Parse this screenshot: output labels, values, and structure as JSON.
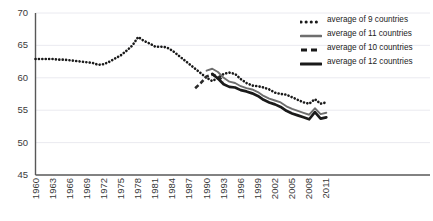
{
  "chart_data": {
    "type": "line",
    "title": "",
    "subtitle": "",
    "xlabel": "",
    "ylabel": "",
    "xlim": [
      1960,
      2012
    ],
    "ylim": [
      45,
      70
    ],
    "ytick_labels": [
      "70",
      "65",
      "60",
      "55",
      "50",
      "45"
    ],
    "ytick_values": [
      70,
      65,
      60,
      55,
      50,
      45
    ],
    "xtick_labels": [
      "1960",
      "1963",
      "1966",
      "1969",
      "1972",
      "1975",
      "1978",
      "1981",
      "1984",
      "1987",
      "1990",
      "1993",
      "1996",
      "1999",
      "2002",
      "2005",
      "2008",
      "2011"
    ],
    "xtick_values": [
      1960,
      1963,
      1966,
      1969,
      1972,
      1975,
      1978,
      1981,
      1984,
      1987,
      1990,
      1993,
      1996,
      1999,
      2002,
      2005,
      2008,
      2011
    ],
    "grid": true,
    "grid_axis": "y",
    "legend_position": "top-right",
    "series": [
      {
        "name": "average of 9 countries",
        "style": "dotted",
        "color": "#1a1a1a",
        "x": [
          1960,
          1961,
          1962,
          1963,
          1964,
          1965,
          1966,
          1967,
          1968,
          1969,
          1970,
          1971,
          1972,
          1973,
          1974,
          1975,
          1976,
          1977,
          1978,
          1979,
          1980,
          1981,
          1982,
          1983,
          1984,
          1985,
          1986,
          1987,
          1988,
          1989,
          1990,
          1991,
          1992,
          1993,
          1994,
          1995,
          1996,
          1997,
          1998,
          1999,
          2000,
          2001,
          2002,
          2003,
          2004,
          2005,
          2006,
          2007,
          2008,
          2009,
          2010,
          2011
        ],
        "values": [
          62.9,
          62.9,
          62.9,
          62.9,
          62.8,
          62.8,
          62.7,
          62.6,
          62.5,
          62.4,
          62.3,
          62.0,
          62.1,
          62.5,
          63.0,
          63.5,
          64.2,
          65.0,
          66.3,
          65.7,
          65.3,
          64.8,
          64.8,
          64.7,
          64.2,
          63.5,
          62.8,
          62.1,
          61.4,
          60.7,
          60.0,
          59.5,
          60.0,
          60.6,
          60.8,
          60.6,
          59.8,
          59.2,
          58.8,
          58.7,
          58.5,
          58.2,
          57.7,
          57.5,
          57.4,
          57.0,
          56.6,
          56.2,
          56.0,
          56.7,
          56.0,
          56.2
        ]
      },
      {
        "name": "average of 11 countries",
        "style": "solid-thin",
        "color": "#6e6e6e",
        "x": [
          1990,
          1991,
          1992,
          1993,
          1994,
          1995,
          1996,
          1997,
          1998,
          1999,
          2000,
          2001,
          2002,
          2003,
          2004,
          2005,
          2006,
          2007,
          2008,
          2009,
          2010,
          2011
        ],
        "values": [
          61.1,
          61.4,
          60.9,
          60.0,
          59.4,
          59.2,
          58.7,
          58.4,
          58.2,
          57.8,
          57.2,
          56.8,
          56.5,
          56.2,
          55.6,
          55.2,
          54.9,
          54.6,
          54.3,
          55.3,
          54.4,
          54.6
        ]
      },
      {
        "name": "average of 10 countries",
        "style": "dashed",
        "color": "#2a2a2a",
        "x": [
          1988,
          1989,
          1990,
          1991,
          1992,
          1993
        ],
        "values": [
          58.4,
          59.2,
          60.2,
          60.5,
          60.2,
          59.5
        ]
      },
      {
        "name": "average of 12 countries",
        "style": "solid-thick",
        "color": "#1a1a1a",
        "x": [
          1991,
          1992,
          1993,
          1994,
          1995,
          1996,
          1997,
          1998,
          1999,
          2000,
          2001,
          2002,
          2003,
          2004,
          2005,
          2006,
          2007,
          2008,
          2009,
          2010,
          2011
        ],
        "values": [
          60.6,
          59.9,
          59.0,
          58.6,
          58.5,
          58.1,
          57.9,
          57.6,
          57.2,
          56.6,
          56.2,
          55.9,
          55.5,
          54.9,
          54.5,
          54.2,
          53.9,
          53.6,
          54.7,
          53.7,
          53.9
        ]
      }
    ]
  },
  "legend": {
    "items": [
      {
        "label": "average of 9 countries",
        "style": "dotted"
      },
      {
        "label": "average of 11 countries",
        "style": "solid-thin"
      },
      {
        "label": "average of 10 countries",
        "style": "dashed"
      },
      {
        "label": "average of 12 countries",
        "style": "solid-thick"
      }
    ]
  },
  "colors": {
    "axis": "#585858",
    "grid": "#e8e8ee",
    "tick_text": "#3a3a3a",
    "series_dark": "#1a1a1a",
    "series_gray": "#6e6e6e",
    "background": "#ffffff"
  }
}
